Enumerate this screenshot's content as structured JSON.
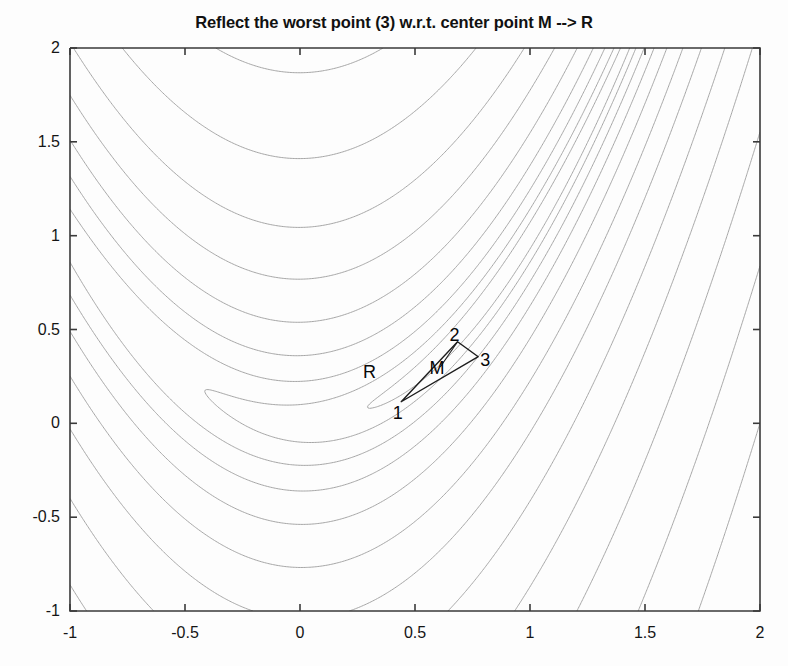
{
  "figure": {
    "title": "Reflect the worst point (3) w.r.t. center point M --> R",
    "background_color": "#fdfdfd",
    "axes_color": "#3a3a3a",
    "contour_color": "#9a9a9a",
    "annotation_color": "#080808"
  },
  "axes": {
    "x_ticks": [
      "-1",
      "-0.5",
      "0",
      "0.5",
      "1",
      "1.5",
      "2"
    ],
    "x_tick_values": [
      -1,
      -0.5,
      0,
      0.5,
      1,
      1.5,
      2
    ],
    "y_ticks": [
      "2",
      "1.5",
      "1",
      "0.5",
      "0",
      "-0.5",
      "-1"
    ],
    "y_tick_values": [
      2,
      1.5,
      1,
      0.5,
      0,
      -0.5,
      -1
    ],
    "xlim": [
      -1,
      2
    ],
    "ylim": [
      -1,
      2
    ],
    "xlabel": "",
    "ylabel": ""
  },
  "annotations": {
    "points": [
      {
        "name": "vertex-1",
        "label": "1",
        "x": 0.44,
        "y": 0.115,
        "label_x": 0.425,
        "label_y": 0.055
      },
      {
        "name": "vertex-2",
        "label": "2",
        "x": 0.685,
        "y": 0.435,
        "label_x": 0.672,
        "label_y": 0.47
      },
      {
        "name": "vertex-3",
        "label": "3",
        "x": 0.775,
        "y": 0.355,
        "label_x": 0.805,
        "label_y": 0.335
      },
      {
        "name": "centroid-M",
        "label": "M",
        "x": 0.61,
        "y": 0.3,
        "label_x": 0.596,
        "label_y": 0.295
      },
      {
        "name": "reflected-R",
        "label": "R",
        "x": 0.3,
        "y": 0.275,
        "label_x": 0.302,
        "label_y": 0.275
      }
    ],
    "triangle_vertices": [
      {
        "x": 0.44,
        "y": 0.115
      },
      {
        "x": 0.685,
        "y": 0.435
      },
      {
        "x": 0.775,
        "y": 0.355
      }
    ],
    "reflection_segment": {
      "from": {
        "x": 0.685,
        "y": 0.435
      },
      "to": {
        "x": 0.61,
        "y": 0.3
      }
    }
  },
  "chart_data": {
    "type": "line",
    "subtype": "contour",
    "title": "Reflect the worst point (3) w.r.t. center point M --> R",
    "xlabel": "",
    "ylabel": "",
    "xlim": [
      -1,
      2
    ],
    "ylim": [
      -1,
      2
    ],
    "grid": false,
    "legend": "none",
    "function": "Rosenbrock: f(x,y) = (1-x)^2 + 100*(y-x^2)^2",
    "minimum": {
      "x": 1,
      "y": 1,
      "value": 0
    },
    "contour_levels": [
      0.5,
      2,
      6,
      14,
      30,
      60,
      110,
      200,
      350,
      600,
      1000,
      1600,
      2500
    ],
    "series": [
      {
        "name": "contour-lines",
        "color": "#9a9a9a",
        "width": 0.9
      },
      {
        "name": "simplex-triangle",
        "color": "#2a2a2a",
        "width": 1.3
      }
    ]
  }
}
